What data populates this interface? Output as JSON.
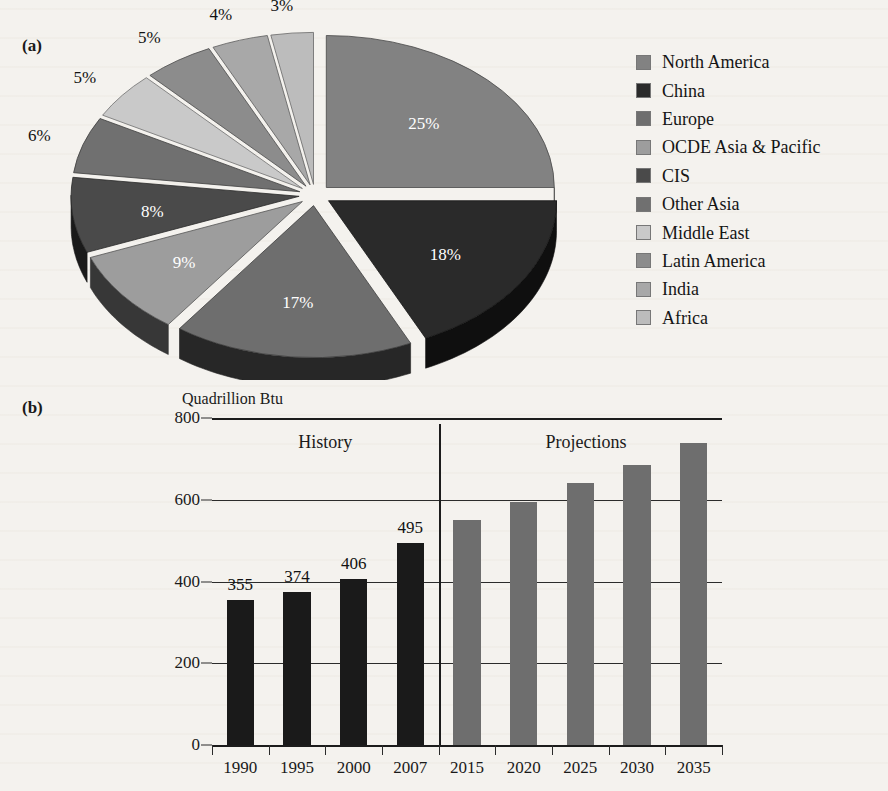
{
  "figure": {
    "panel_a_label": "(a)",
    "panel_b_label": "(b)"
  },
  "chart_data": [
    {
      "type": "pie",
      "title": "",
      "panel": "(a)",
      "legend_position": "right",
      "labels": [
        "North America",
        "China",
        "Europe",
        "OCDE Asia & Pacific",
        "CIS",
        "Other Asia",
        "Middle East",
        "Latin America",
        "India",
        "Africa"
      ],
      "values": [
        25,
        18,
        17,
        9,
        8,
        6,
        5,
        5,
        4,
        3
      ],
      "value_labels": [
        "25%",
        "18%",
        "17%",
        "9%",
        "8%",
        "6%",
        "5%",
        "5%",
        "4%",
        "3%"
      ],
      "colors": [
        "#828282",
        "#2a2a2a",
        "#6e6e6e",
        "#9d9d9d",
        "#4a4a4a",
        "#707070",
        "#c9c9c9",
        "#8c8c8c",
        "#a8a8a8",
        "#bcbcbc"
      ],
      "exploded": true,
      "three_d": true
    },
    {
      "type": "bar",
      "panel": "(b)",
      "title": "",
      "ylabel": "Quadrillion Btu",
      "xlabel": "",
      "ylim": [
        0,
        800
      ],
      "yticks": [
        0,
        200,
        400,
        600,
        800
      ],
      "ytick_labels": [
        "0",
        "200",
        "400",
        "600",
        "800"
      ],
      "grid": true,
      "categories": [
        "1990",
        "1995",
        "2000",
        "2007",
        "2015",
        "2020",
        "2025",
        "2030",
        "2035"
      ],
      "values": [
        355,
        374,
        406,
        495,
        550,
        595,
        640,
        685,
        740
      ],
      "value_labels": [
        "355",
        "374",
        "406",
        "495",
        "",
        "",
        "",
        "",
        ""
      ],
      "series_regions": [
        {
          "name": "History",
          "categories": [
            "1990",
            "1995",
            "2000",
            "2007"
          ],
          "color": "#1a1a1a"
        },
        {
          "name": "Projections",
          "categories": [
            "2015",
            "2020",
            "2025",
            "2030",
            "2035"
          ],
          "color": "#6e6e6e"
        }
      ],
      "annotations": [
        "History",
        "Projections"
      ]
    }
  ],
  "pie": {
    "slices": [
      {
        "label": "North America",
        "pct": "25%",
        "value": 25,
        "color": "#828282"
      },
      {
        "label": "China",
        "pct": "18%",
        "value": 18,
        "color": "#2a2a2a"
      },
      {
        "label": "Europe",
        "pct": "17%",
        "value": 17,
        "color": "#6e6e6e"
      },
      {
        "label": "OCDE Asia & Pacific",
        "pct": "9%",
        "value": 9,
        "color": "#9d9d9d"
      },
      {
        "label": "CIS",
        "pct": "8%",
        "value": 8,
        "color": "#4a4a4a"
      },
      {
        "label": "Other Asia",
        "pct": "6%",
        "value": 6,
        "color": "#707070"
      },
      {
        "label": "Middle East",
        "pct": "5%",
        "value": 5,
        "color": "#c9c9c9"
      },
      {
        "label": "Latin America",
        "pct": "5%",
        "value": 5,
        "color": "#8c8c8c"
      },
      {
        "label": "India",
        "pct": "4%",
        "value": 4,
        "color": "#a8a8a8"
      },
      {
        "label": "Africa",
        "pct": "3%",
        "value": 3,
        "color": "#bcbcbc"
      }
    ]
  },
  "bar": {
    "axis_title": "Quadrillion Btu",
    "history_label": "History",
    "projections_label": "Projections",
    "yticks": [
      "800",
      "600",
      "400",
      "200",
      "0"
    ],
    "bars": [
      {
        "year": "1990",
        "value": 355,
        "label": "355",
        "group": "history"
      },
      {
        "year": "1995",
        "value": 374,
        "label": "374",
        "group": "history"
      },
      {
        "year": "2000",
        "value": 406,
        "label": "406",
        "group": "history"
      },
      {
        "year": "2007",
        "value": 495,
        "label": "495",
        "group": "history"
      },
      {
        "year": "2015",
        "value": 550,
        "label": "",
        "group": "projection"
      },
      {
        "year": "2020",
        "value": 595,
        "label": "",
        "group": "projection"
      },
      {
        "year": "2025",
        "value": 640,
        "label": "",
        "group": "projection"
      },
      {
        "year": "2030",
        "value": 685,
        "label": "",
        "group": "projection"
      },
      {
        "year": "2035",
        "value": 740,
        "label": "",
        "group": "projection"
      }
    ],
    "colors": {
      "history": "#1a1a1a",
      "projection": "#6e6e6e"
    }
  }
}
